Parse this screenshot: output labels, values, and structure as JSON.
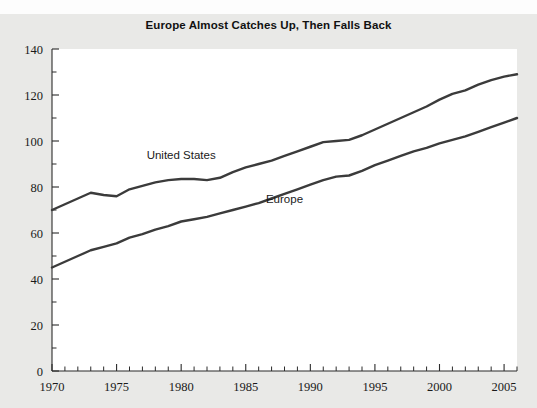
{
  "chart": {
    "title": "Europe Almost Catches Up, Then Falls Back"
  },
  "chart_data": {
    "type": "line",
    "title": "Europe Almost Catches Up, Then Falls Back",
    "xlabel": "",
    "ylabel": "",
    "xlim": [
      1970,
      2006
    ],
    "ylim": [
      0,
      140
    ],
    "grid": false,
    "legend_position": "inline-annotations",
    "x_ticks_major": [
      1970,
      1975,
      1980,
      1985,
      1990,
      1995,
      2000,
      2005
    ],
    "x_tick_labels": [
      "1970",
      "1975",
      "1980",
      "1985",
      "1990",
      "1995",
      "2000",
      "2005"
    ],
    "x_tick_minor_step": 1,
    "y_ticks_major": [
      0,
      20,
      40,
      60,
      80,
      100,
      120,
      140
    ],
    "y_tick_labels": [
      "0",
      "20",
      "40",
      "60",
      "80",
      "100",
      "120",
      "140"
    ],
    "y_tick_minor_step": 10,
    "x": [
      1970,
      1971,
      1972,
      1973,
      1974,
      1975,
      1976,
      1977,
      1978,
      1979,
      1980,
      1981,
      1982,
      1983,
      1984,
      1985,
      1986,
      1987,
      1988,
      1989,
      1990,
      1991,
      1992,
      1993,
      1994,
      1995,
      1996,
      1997,
      1998,
      1999,
      2000,
      2001,
      2002,
      2003,
      2004,
      2005,
      2006
    ],
    "series": [
      {
        "name": "United States",
        "label": "United States",
        "color": "#3b3b3b",
        "values": [
          70,
          72.5,
          75,
          77.5,
          76.5,
          76,
          79,
          80.5,
          82,
          83,
          83.5,
          83.5,
          83,
          84,
          86.5,
          88.5,
          90,
          91.5,
          93.5,
          95.5,
          97.5,
          99.5,
          100,
          100.5,
          102.5,
          105,
          107.5,
          110,
          112.5,
          115,
          118,
          120.5,
          122,
          124.5,
          126.5,
          128,
          129
        ]
      },
      {
        "name": "Europe",
        "label": "Europe",
        "color": "#3b3b3b",
        "values": [
          45,
          47.5,
          50,
          52.5,
          54,
          55.5,
          58,
          59.5,
          61.5,
          63,
          65,
          66,
          67,
          68.5,
          70,
          71.5,
          73,
          75,
          77,
          79,
          81,
          83,
          84.5,
          85,
          87,
          89.5,
          91.5,
          93.5,
          95.5,
          97,
          99,
          100.5,
          102,
          104,
          106,
          108,
          110
        ]
      }
    ],
    "annotations": [
      {
        "text": "United States",
        "x": 1980,
        "y": 92,
        "series": "United States"
      },
      {
        "text": "Europe",
        "x": 1988,
        "y": 73,
        "series": "Europe"
      }
    ]
  }
}
